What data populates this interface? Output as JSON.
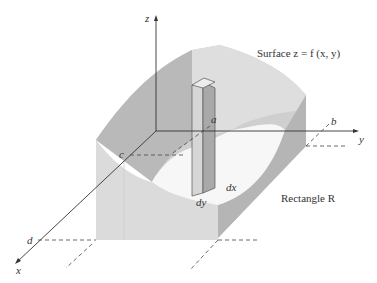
{
  "figure": {
    "surface_label": "Surface z = f (x, y)",
    "rectangle_label": "Rectangle R",
    "axes": {
      "x": "x",
      "y": "y",
      "z": "z"
    },
    "bounds": {
      "a": "a",
      "b": "b",
      "c": "c",
      "d": "d"
    },
    "column_labels": {
      "dx": "dx",
      "dy": "dy"
    }
  },
  "colors": {
    "surface_dark": "#b8b8b8",
    "surface_mid": "#cdcdcd",
    "surface_light": "#e2e2e2",
    "front_face": "#dcdcdc",
    "rectangle_base": "#f6f6f6",
    "axis": "#333333"
  }
}
